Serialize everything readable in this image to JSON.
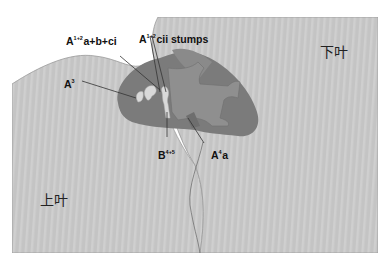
{
  "diagram": {
    "type": "anatomical illustration",
    "colors": {
      "background": "#ffffff",
      "lobe_fill": "#c4c4c4",
      "lobe_stripe": "#cfcfcf",
      "lobe_edge": "#9a9a9a",
      "hilum_dark": "#7b7b7b",
      "hilum_mid": "#8f8f8f",
      "vessel_stump": "#d9d9d9",
      "leader_line": "#333333",
      "text": "#111111"
    },
    "regions": {
      "lower_lobe": {
        "label": "下叶"
      },
      "upper_lobe": {
        "label": "上叶"
      }
    },
    "labels": [
      {
        "id": "a1plus2",
        "base": "A",
        "sup": "1+2",
        "rest": "a+b+ci"
      },
      {
        "id": "a1plus2-cii",
        "base": "A",
        "sup": "1+2",
        "rest": "cii stumps"
      },
      {
        "id": "a3",
        "base": "A",
        "sup": "3",
        "rest": ""
      },
      {
        "id": "b4plus5",
        "base": "B",
        "sup": "4+5",
        "rest": ""
      },
      {
        "id": "a4a",
        "base": "A",
        "sup": "4",
        "rest": "a"
      }
    ]
  }
}
